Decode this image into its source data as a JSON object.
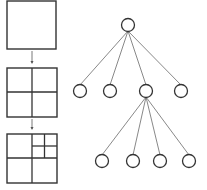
{
  "diagram": {
    "type": "quadtree-subdivision",
    "colors": {
      "stroke": "#333333",
      "edge": "#555555",
      "background": "#ffffff"
    },
    "squares": [
      {
        "id": "level-0",
        "x": 7,
        "y": 1,
        "size": 49,
        "subdivisions": "none"
      },
      {
        "id": "level-1",
        "x": 7,
        "y": 68,
        "size": 50,
        "subdivisions": "2x2"
      },
      {
        "id": "level-2",
        "x": 7,
        "y": 134,
        "size": 50,
        "subdivisions": "2x2 with top-right quadrant split 2x2"
      }
    ],
    "tree": {
      "root": {
        "cx": 128,
        "cy": 25,
        "r": 6.5
      },
      "level1": [
        {
          "cx": 80,
          "cy": 91,
          "r": 6.5
        },
        {
          "cx": 110,
          "cy": 91,
          "r": 6.5
        },
        {
          "cx": 146,
          "cy": 91,
          "r": 6.5
        },
        {
          "cx": 181,
          "cy": 91,
          "r": 6.5
        }
      ],
      "level2_parent_index": 2,
      "level2": [
        {
          "cx": 102,
          "cy": 161,
          "r": 6.5
        },
        {
          "cx": 133,
          "cy": 161,
          "r": 6.5
        },
        {
          "cx": 160,
          "cy": 161,
          "r": 6.5
        },
        {
          "cx": 189,
          "cy": 161,
          "r": 6.5
        }
      ]
    }
  }
}
